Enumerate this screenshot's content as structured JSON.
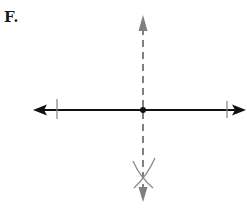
{
  "figure": {
    "label": "F."
  },
  "colors": {
    "main_line": "#111111",
    "construction": "#808080",
    "point": "#111111",
    "background": "#ffffff"
  },
  "geometry": {
    "horizontal_line": {
      "y": 110,
      "x_start": 33,
      "x_end": 246
    },
    "tick_marks": [
      {
        "x": 57,
        "y1": 99,
        "y2": 119
      },
      {
        "x": 227,
        "y1": 101,
        "y2": 118
      }
    ],
    "center_point": {
      "x": 143,
      "y": 110,
      "r": 3
    },
    "vertical_dashed_line": {
      "x": 143,
      "y_start": 15,
      "y_end": 202
    },
    "arcs_intersection": {
      "x": 143,
      "y": 176
    }
  }
}
